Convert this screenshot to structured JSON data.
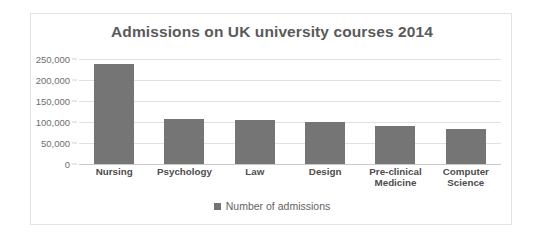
{
  "chart_data": {
    "type": "bar",
    "title": "Admissions on UK university courses 2014",
    "xlabel": "",
    "ylabel": "",
    "categories": [
      "Nursing",
      "Psychology",
      "Law",
      "Design",
      "Pre-clinical Medicine",
      "Computer Science"
    ],
    "category_lines": [
      [
        "Nursing"
      ],
      [
        "Psychology"
      ],
      [
        "Law"
      ],
      [
        "Design"
      ],
      [
        "Pre-clinical",
        "Medicine"
      ],
      [
        "Computer",
        "Science"
      ]
    ],
    "values": [
      238000,
      107000,
      105000,
      100000,
      90000,
      83000
    ],
    "series": [
      {
        "name": "Number of admissions",
        "values": [
          238000,
          107000,
          105000,
          100000,
          90000,
          83000
        ]
      }
    ],
    "ylim": [
      0,
      250000
    ],
    "ytick_values": [
      250000,
      200000,
      150000,
      100000,
      50000,
      0
    ],
    "ytick_labels": [
      "250,000",
      "200,000",
      "150,000",
      "100,000",
      "50,000",
      "0"
    ],
    "grid": true,
    "legend_position": "bottom",
    "legend_entries": [
      "Number of admissions"
    ],
    "bar_color": "#757575",
    "grid_color": "#e0e0e0",
    "title_color": "#5a5a5a",
    "background_color": "#ffffff"
  },
  "legend": {
    "label": "Number of admissions"
  }
}
